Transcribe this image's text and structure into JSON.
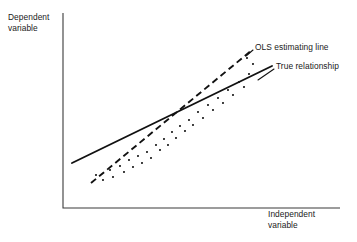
{
  "chart_data": {
    "type": "scatter",
    "title": "",
    "subtitle": "",
    "xlabel": "Independent\nvariable",
    "ylabel": "Dependent\nvariable",
    "grid": false,
    "legend_position": "inline-annotations",
    "axis_style": "two-axis-corner-no-ticks",
    "xlim": [
      0,
      1
    ],
    "ylim": [
      0,
      1
    ],
    "axes_pixels": {
      "x_origin": 63,
      "y_origin": 208,
      "y_top": 13,
      "x_right": 340
    },
    "annotations": [
      {
        "name": "ols-estimating-line",
        "text": "OLS estimating line",
        "label_x": 255,
        "label_y": 42,
        "leader": {
          "x1": 253,
          "y1": 50,
          "x2": 246,
          "y2": 56
        }
      },
      {
        "name": "true-relationship",
        "text": "True relationship",
        "label_x": 276,
        "label_y": 61,
        "leader": {
          "x1": 274,
          "y1": 69,
          "x2": 258,
          "y2": 80
        }
      }
    ],
    "series": [
      {
        "name": "True relationship",
        "type": "line",
        "style": "solid",
        "points_pixels": [
          [
            72,
            163
          ],
          [
            272,
            66
          ]
        ]
      },
      {
        "name": "OLS estimating line",
        "type": "line",
        "style": "dashed",
        "points_pixels": [
          [
            91,
            183
          ],
          [
            252,
            50
          ]
        ]
      },
      {
        "name": "Observations",
        "type": "scatter",
        "points_pixels": [
          [
            96,
            175
          ],
          [
            103,
            180
          ],
          [
            110,
            170
          ],
          [
            113,
            177
          ],
          [
            120,
            166
          ],
          [
            124,
            172
          ],
          [
            129,
            160
          ],
          [
            133,
            167
          ],
          [
            138,
            156
          ],
          [
            142,
            163
          ],
          [
            147,
            152
          ],
          [
            151,
            158
          ],
          [
            156,
            145
          ],
          [
            160,
            150
          ],
          [
            164,
            139
          ],
          [
            168,
            145
          ],
          [
            172,
            132
          ],
          [
            176,
            138
          ],
          [
            180,
            126
          ],
          [
            185,
            131
          ],
          [
            189,
            120
          ],
          [
            193,
            125
          ],
          [
            198,
            112
          ],
          [
            203,
            118
          ],
          [
            208,
            105
          ],
          [
            213,
            110
          ],
          [
            218,
            98
          ],
          [
            223,
            103
          ],
          [
            228,
            90
          ],
          [
            233,
            95
          ],
          [
            239,
            82
          ],
          [
            244,
            87
          ],
          [
            249,
            74
          ],
          [
            253,
            64
          ],
          [
            247,
            58
          ]
        ]
      }
    ]
  }
}
